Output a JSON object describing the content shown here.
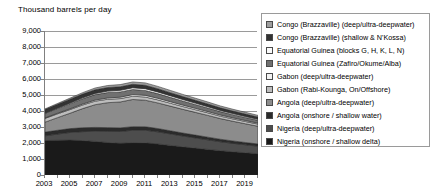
{
  "chart": {
    "axis_title": "Thousand barrels per day"
  },
  "chart_data": {
    "type": "area",
    "stacked": true,
    "title": "",
    "subtitle": "",
    "xlabel": "",
    "ylabel": "Thousand barrels per day",
    "grid": true,
    "legend_position": "right",
    "xlim": [
      2003,
      2020
    ],
    "ylim": [
      0,
      9000
    ],
    "yticks": [
      0,
      1000,
      2000,
      3000,
      4000,
      5000,
      6000,
      7000,
      8000,
      9000
    ],
    "ytick_labels": [
      "0",
      "1,000",
      "2,000",
      "3,000",
      "4,000",
      "5,000",
      "6,000",
      "7,000",
      "8,000",
      "9,000"
    ],
    "xticks": [
      2003,
      2005,
      2007,
      2009,
      2011,
      2013,
      2015,
      2017,
      2019
    ],
    "xtick_labels": [
      "2003",
      "2005",
      "2007",
      "2009",
      "2011",
      "2013",
      "2015",
      "2017",
      "2019"
    ],
    "x": [
      2003,
      2004,
      2005,
      2006,
      2007,
      2008,
      2009,
      2010,
      2011,
      2012,
      2013,
      2014,
      2015,
      2016,
      2017,
      2018,
      2019,
      2020
    ],
    "series": [
      {
        "name": "Nigeria (onshore / shallow delta)",
        "color": "#1a1a1a",
        "pattern": "solid-dark",
        "values": [
          2150,
          2170,
          2180,
          2150,
          2100,
          2030,
          1980,
          2020,
          2010,
          1940,
          1850,
          1760,
          1680,
          1600,
          1520,
          1450,
          1390,
          1330
        ]
      },
      {
        "name": "Nigeria (deep/ultra-deepwater)",
        "color": "#4d4d4d",
        "pattern": "solid-mid-dark",
        "values": [
          300,
          390,
          480,
          560,
          640,
          700,
          740,
          780,
          790,
          760,
          720,
          680,
          640,
          600,
          560,
          530,
          500,
          470
        ]
      },
      {
        "name": "Angola (onshore / shallow water)",
        "color": "#2b2b2b",
        "pattern": "solid-charcoal",
        "values": [
          230,
          235,
          240,
          240,
          235,
          230,
          225,
          220,
          215,
          205,
          195,
          185,
          175,
          165,
          155,
          148,
          142,
          136
        ]
      },
      {
        "name": "Angola (deep/ultra-deepwater)",
        "color": "#8c8c8c",
        "pattern": "solid-grey",
        "values": [
          620,
          790,
          960,
          1200,
          1420,
          1560,
          1620,
          1700,
          1660,
          1600,
          1540,
          1480,
          1420,
          1360,
          1290,
          1230,
          1170,
          1110
        ]
      },
      {
        "name": "Gabon (Rabi-Kounga, On/Offshore)",
        "color": "#bdbdbd",
        "pattern": "light-grey",
        "values": [
          240,
          235,
          230,
          225,
          220,
          215,
          210,
          205,
          200,
          192,
          184,
          176,
          168,
          160,
          152,
          146,
          140,
          134
        ]
      },
      {
        "name": "Gabon (deep/ultra-deepwater)",
        "color": "#f2f2f2",
        "pattern": "white",
        "values": [
          30,
          40,
          50,
          60,
          70,
          80,
          90,
          100,
          105,
          100,
          95,
          90,
          85,
          80,
          75,
          70,
          66,
          62
        ]
      },
      {
        "name": "Equatorial Guinea (Zafiro/Okume/Alba)",
        "color": "#707070",
        "pattern": "mid-grey",
        "values": [
          280,
          300,
          320,
          330,
          340,
          340,
          330,
          320,
          305,
          290,
          272,
          255,
          240,
          225,
          210,
          198,
          188,
          178
        ]
      },
      {
        "name": "Equatorial Guinea (blocks G, H, K, L, N)",
        "color": "#fafafa",
        "pattern": "white",
        "values": [
          20,
          30,
          45,
          60,
          75,
          90,
          100,
          110,
          112,
          106,
          100,
          94,
          88,
          82,
          76,
          72,
          68,
          64
        ]
      },
      {
        "name": "Congo (Brazzaville) (shallow & N'Kossa)",
        "color": "#333333",
        "pattern": "dark",
        "values": [
          220,
          225,
          230,
          230,
          228,
          224,
          220,
          215,
          210,
          200,
          190,
          182,
          174,
          166,
          158,
          152,
          146,
          140
        ]
      },
      {
        "name": "Congo (Brazzaville) (deep/ultra-deepwater)",
        "color": "#9e9e9e",
        "pattern": "grey",
        "values": [
          40,
          55,
          70,
          90,
          110,
          125,
          135,
          145,
          150,
          145,
          140,
          135,
          130,
          124,
          118,
          112,
          107,
          102
        ]
      }
    ],
    "totals": [
      4130,
      4470,
      4805,
      5145,
      5438,
      5594,
      5650,
      5815,
      5757,
      5538,
      5286,
      5037,
      4800,
      4562,
      4314,
      4108,
      3917,
      3726
    ]
  },
  "legend": {
    "items": [
      {
        "label": "Congo (Brazzaville) (deep/ultra-deepwater)",
        "swatch": "#9e9e9e"
      },
      {
        "label": "Congo (Brazzaville) (shallow & N'Kossa)",
        "swatch": "#333333"
      },
      {
        "label": "Equatorial Guinea (blocks G, H, K, L, N)",
        "swatch": "#fafafa"
      },
      {
        "label": "Equatorial Guinea (Zafiro/Okume/Alba)",
        "swatch": "#707070"
      },
      {
        "label": "Gabon (deep/ultra-deepwater)",
        "swatch": "#f2f2f2"
      },
      {
        "label": "Gabon (Rabi-Kounga, On/Offshore)",
        "swatch": "#bdbdbd"
      },
      {
        "label": "Angola (deep/ultra-deepwater)",
        "swatch": "#8c8c8c"
      },
      {
        "label": "Angola (onshore / shallow water)",
        "swatch": "#2b2b2b"
      },
      {
        "label": "Nigeria (deep/ultra-deepwater)",
        "swatch": "#4d4d4d"
      },
      {
        "label": "Nigeria (onshore / shallow delta)",
        "swatch": "#1a1a1a"
      }
    ]
  }
}
